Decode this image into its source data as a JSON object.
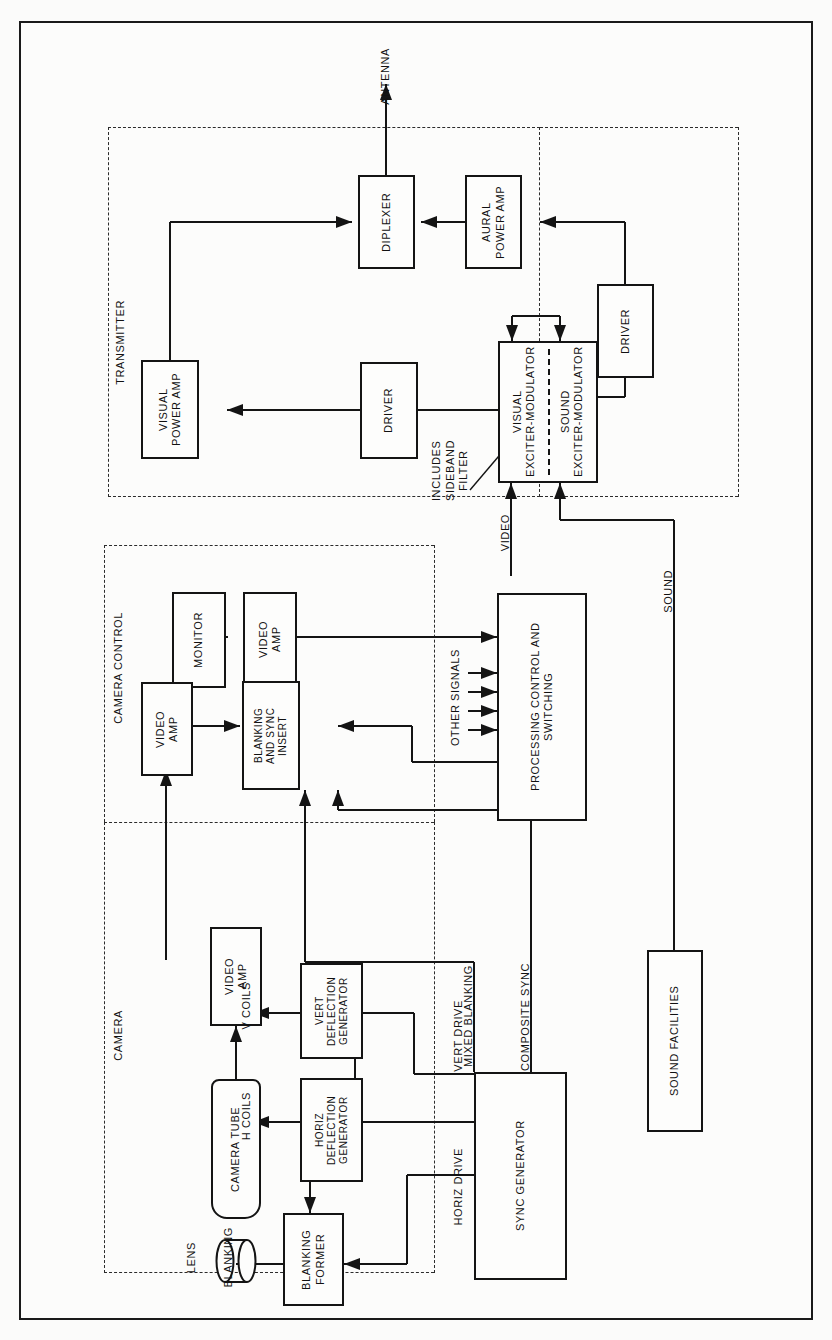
{
  "diagram": {
    "orientation": "rotated-90-ccw",
    "outer_border": true
  },
  "sections": [
    {
      "name": "transmitter",
      "label": "TRANSMITTER"
    },
    {
      "name": "camera-control",
      "label": "CAMERA CONTROL"
    },
    {
      "name": "camera",
      "label": "CAMERA"
    }
  ],
  "blocks": {
    "diplexer": "DIPLEXER",
    "aural_power_amp": "AURAL\nPOWER AMP",
    "driver_aural": "DRIVER",
    "visual_power_amp": "VISUAL\nPOWER AMP",
    "driver_visual": "DRIVER",
    "visual_exciter_modulator": "VISUAL\nEXCITER-MODULATOR",
    "sound_exciter_modulator": "SOUND\nEXCITER-MODULATOR",
    "monitor": "MONITOR",
    "video_amp_monitor": "VIDEO\nAMP",
    "video_amp_control": "VIDEO\nAMP",
    "blanking_and_sync_insert": "BLANKING\nAND SYNC\nINSERT",
    "processing_control_switching": "PROCESSING CONTROL AND\nSWITCHING",
    "sound_facilities": "SOUND FACILITIES",
    "video_amp_camera": "VIDEO\nAMP",
    "camera_tube": "CAMERA TUBE",
    "vert_deflection_generator": "VERT\nDEFLECTION\nGENERATOR",
    "horiz_deflection_generator": "HORIZ\nDEFLECTION\nGENERATOR",
    "blanking_former": "BLANKING\nFORMER",
    "sync_generator": "SYNC GENERATOR"
  },
  "signal_labels": {
    "antenna": "ANTENNA",
    "includes_sideband_filter": "INCLUDES\nSIDEBAND\nFILTER",
    "video": "VIDEO",
    "sound": "SOUND",
    "other_signals": "OTHER SIGNALS",
    "mixed_blanking": "MIXED BLANKING",
    "composite_sync": "COMPOSITE SYNC",
    "vert_drive": "VERT DRIVE",
    "horiz_drive": "HORIZ DRIVE",
    "v_coils": "V COILS",
    "h_coils": "H COILS",
    "blanking": "BLANKING",
    "lens": "LENS"
  },
  "colors": {
    "line": "#141414",
    "dashed": "#2b2b2b",
    "background": "#fcfcfb",
    "text": "#111111"
  }
}
